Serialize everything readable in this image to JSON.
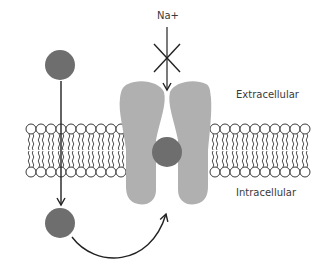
{
  "diagram": {
    "labels": {
      "ion": "Na+",
      "outside": "Extracellular",
      "inside": "Intracellular"
    },
    "colors": {
      "ion": "#6e6e6e",
      "channel": "#b0b0b0",
      "membrane_stroke": "#3a3a3a",
      "arrow": "#222222",
      "text": "#3a3a3a"
    },
    "elements": [
      {
        "type": "ion",
        "position": "extracellular-left"
      },
      {
        "type": "ion",
        "position": "channel-pore"
      },
      {
        "type": "ion",
        "position": "intracellular-left"
      },
      {
        "type": "channel-protein",
        "lobes": 2
      },
      {
        "type": "lipid-bilayer",
        "segments": 2
      },
      {
        "type": "arrow",
        "from": "extracellular-left",
        "to": "intracellular-left",
        "style": "straight"
      },
      {
        "type": "arrow",
        "from": "intracellular-left",
        "to": "channel-bottom",
        "style": "curved"
      },
      {
        "type": "arrow",
        "from": "Na+",
        "to": "channel-top",
        "style": "straight-blocked"
      }
    ]
  }
}
